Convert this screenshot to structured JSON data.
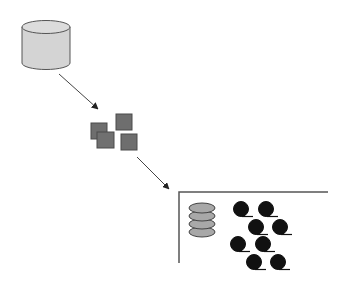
{
  "diagram": {
    "colors": {
      "background": "#ffffff",
      "cylinder_fill": "#d4d4d4",
      "cylinder_stroke": "#555555",
      "block_fill": "#6e6e6e",
      "block_stroke": "#4a4a4a",
      "disk_fill": "#a8a8a8",
      "reel_fill": "#111111",
      "line": "#444444"
    },
    "nodes": [
      {
        "id": "database",
        "shape": "cylinder"
      },
      {
        "id": "data-blocks",
        "shape": "squares",
        "count": 4
      },
      {
        "id": "storage",
        "shape": "bracket",
        "contents": [
          "disk-stack",
          "tape-reels"
        ]
      }
    ],
    "tape_reel_count": 8,
    "disk_platter_count": 4
  }
}
